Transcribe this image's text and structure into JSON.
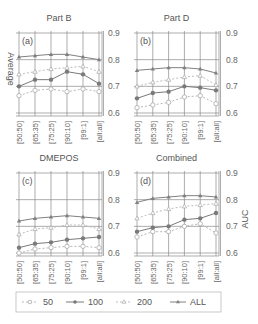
{
  "chart_data": [
    {
      "type": "line",
      "panel": "(a)",
      "title": "Part B",
      "ylabel": "Average",
      "ylim": [
        0.6,
        0.9
      ],
      "yticks": [
        "0.9",
        "0.8",
        "0.7",
        "0.6"
      ],
      "grid": true,
      "categories": [
        "[50:50]",
        "[65:35]",
        "[75:25]",
        "[90:10]",
        "[99:1]",
        "[all:all]"
      ],
      "series": [
        {
          "name": "50",
          "values": [
            0.665,
            0.685,
            0.69,
            0.68,
            0.69,
            0.68
          ]
        },
        {
          "name": "100",
          "values": [
            0.7,
            0.725,
            0.725,
            0.755,
            0.745,
            0.71
          ]
        },
        {
          "name": "200",
          "values": [
            0.745,
            0.755,
            0.765,
            0.77,
            0.775,
            0.755
          ]
        },
        {
          "name": "ALL",
          "values": [
            0.81,
            0.815,
            0.82,
            0.82,
            0.81,
            0.8
          ]
        }
      ]
    },
    {
      "type": "line",
      "panel": "(b)",
      "title": "Part D",
      "ylabel": "",
      "ylim": [
        0.6,
        0.9
      ],
      "yticks": [
        "0.9",
        "0.8",
        "0.7",
        "0.6"
      ],
      "grid": true,
      "categories": [
        "[50:50]",
        "[65:35]",
        "[75:25]",
        "[90:10]",
        "[99:1]",
        "[all:all]"
      ],
      "series": [
        {
          "name": "50",
          "values": [
            0.62,
            0.63,
            0.64,
            0.66,
            0.665,
            0.635
          ]
        },
        {
          "name": "100",
          "values": [
            0.655,
            0.675,
            0.68,
            0.7,
            0.695,
            0.685
          ]
        },
        {
          "name": "200",
          "values": [
            0.7,
            0.715,
            0.725,
            0.735,
            0.74,
            0.705
          ]
        },
        {
          "name": "ALL",
          "values": [
            0.76,
            0.765,
            0.77,
            0.77,
            0.765,
            0.75
          ]
        }
      ]
    },
    {
      "type": "line",
      "panel": "(c)",
      "title": "DMEPOS",
      "ylabel": "",
      "ylim": [
        0.6,
        0.9
      ],
      "yticks": [
        "0.9",
        "0.8",
        "0.7",
        "0.6"
      ],
      "grid": true,
      "categories": [
        "[50:50]",
        "[65:35]",
        "[75:25]",
        "[90:10]",
        "[99:1]",
        "[all:all]"
      ],
      "series": [
        {
          "name": "50",
          "values": [
            0.6,
            0.615,
            0.62,
            0.625,
            0.625,
            0.62
          ]
        },
        {
          "name": "100",
          "values": [
            0.62,
            0.635,
            0.64,
            0.65,
            0.655,
            0.66
          ]
        },
        {
          "name": "200",
          "values": [
            0.67,
            0.69,
            0.695,
            0.705,
            0.705,
            0.69
          ]
        },
        {
          "name": "ALL",
          "values": [
            0.72,
            0.73,
            0.735,
            0.74,
            0.735,
            0.73
          ]
        }
      ]
    },
    {
      "type": "line",
      "panel": "(d)",
      "title": "Combined",
      "ylabel": "AUC",
      "ylim": [
        0.6,
        0.9
      ],
      "yticks": [
        "0.9",
        "0.8",
        "0.7",
        "0.6"
      ],
      "grid": true,
      "categories": [
        "[50:50]",
        "[65:35]",
        "[75:25]",
        "[90:10]",
        "[99:1]",
        "[all:all]"
      ],
      "series": [
        {
          "name": "50",
          "values": [
            0.66,
            0.68,
            0.68,
            0.7,
            0.71,
            0.675
          ]
        },
        {
          "name": "100",
          "values": [
            0.68,
            0.695,
            0.7,
            0.725,
            0.73,
            0.75
          ]
        },
        {
          "name": "200",
          "values": [
            0.73,
            0.75,
            0.765,
            0.775,
            0.78,
            0.785
          ]
        },
        {
          "name": "ALL",
          "values": [
            0.79,
            0.805,
            0.81,
            0.815,
            0.815,
            0.81
          ]
        }
      ]
    }
  ],
  "legend": {
    "position": "bottom",
    "entries": [
      {
        "name": "50",
        "style": "dashed",
        "marker": "open-circle"
      },
      {
        "name": "100",
        "style": "solid",
        "marker": "filled-circle"
      },
      {
        "name": "200",
        "style": "dashed",
        "marker": "open-triangle"
      },
      {
        "name": "ALL",
        "style": "solid",
        "marker": "filled-triangle"
      }
    ]
  },
  "colors": {
    "series_50": "#b8b8b8",
    "series_100": "#7a7a7a",
    "series_200": "#bdbdbd",
    "series_ALL": "#808080",
    "grid": "#8a8a8a",
    "text": "#555555"
  }
}
